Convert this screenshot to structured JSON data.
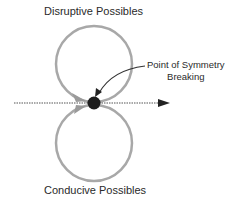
{
  "diagram": {
    "top_label": "Disruptive Possibles",
    "bottom_label": "Conducive Possibles",
    "callout": {
      "line1": "Point of Symmetry",
      "line2": "Breaking"
    },
    "colors": {
      "circle_stroke": "#a8a8a8",
      "dot_fill": "#1e1e1e",
      "axis_line": "#555555",
      "arrow_head": "#222222",
      "text": "#2a2a2a"
    },
    "geometry": {
      "top_circle": {
        "cx": 94,
        "cy": 64,
        "r": 38
      },
      "bottom_circle": {
        "cx": 94,
        "cy": 143,
        "r": 38
      },
      "symmetry_point": {
        "cx": 94,
        "cy": 103,
        "r": 6
      },
      "axis": {
        "x1": 14,
        "y1": 103,
        "x2": 170,
        "y2": 103
      }
    }
  }
}
